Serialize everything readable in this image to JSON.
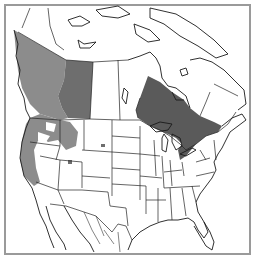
{
  "map": {
    "title": "",
    "region": "North America",
    "legend": [],
    "colors": {
      "background": "#ffffff",
      "frame": "#9a9a9a",
      "border_lines": "#222222",
      "range_light": "#8c8c8c",
      "range_medium": "#6e6e6e",
      "range_dark": "#5a5a5a"
    },
    "shaded_regions": [
      {
        "name": "British Columbia range",
        "shade": "range_light"
      },
      {
        "name": "Alberta range",
        "shade": "range_medium"
      },
      {
        "name": "Ontario range",
        "shade": "range_dark"
      },
      {
        "name": "Pacific Northwest US range",
        "shade": "range_light"
      }
    ]
  }
}
